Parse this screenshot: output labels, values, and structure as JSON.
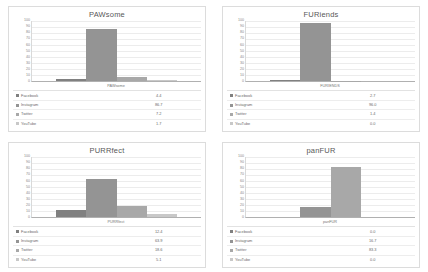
{
  "page": {
    "layout": "2x2 grid of bar charts",
    "background": "#ffffff"
  },
  "series_colors": {
    "Facebook": "#808080",
    "Instagram": "#949494",
    "Twitter": "#a8a8a8",
    "YouTube": "#c8c8c8"
  },
  "axis": {
    "ticks": [
      "100",
      "90",
      "80",
      "70",
      "60",
      "50",
      "40",
      "30",
      "20",
      "10",
      "0"
    ],
    "min": 0,
    "max": 100
  },
  "chart_data": [
    {
      "type": "bar",
      "title": "PAWsome",
      "categories": [
        "PAWsome"
      ],
      "xlabel": "PAWsome",
      "ylabel": "",
      "ylim": [
        0,
        100
      ],
      "grid": true,
      "legend_position": "bottom-table",
      "series": [
        {
          "name": "Facebook",
          "values": [
            4.4
          ],
          "value_label": "4.4"
        },
        {
          "name": "Instagram",
          "values": [
            86.7
          ],
          "value_label": "86.7"
        },
        {
          "name": "Twitter",
          "values": [
            7.2
          ],
          "value_label": "7.2"
        },
        {
          "name": "YouTube",
          "values": [
            1.7
          ],
          "value_label": "1.7"
        }
      ]
    },
    {
      "type": "bar",
      "title": "FURiends",
      "categories": [
        "FURIENDS"
      ],
      "xlabel": "FURIENDS",
      "ylabel": "",
      "ylim": [
        0,
        100
      ],
      "grid": true,
      "legend_position": "bottom-table",
      "series": [
        {
          "name": "Facebook",
          "values": [
            2.7
          ],
          "value_label": "2.7"
        },
        {
          "name": "Instagram",
          "values": [
            96.0
          ],
          "value_label": "96.0"
        },
        {
          "name": "Twitter",
          "values": [
            1.4
          ],
          "value_label": "1.4"
        },
        {
          "name": "YouTube",
          "values": [
            0.0
          ],
          "value_label": "0.0"
        }
      ]
    },
    {
      "type": "bar",
      "title": "PURRfect",
      "categories": [
        "PURRfect"
      ],
      "xlabel": "PURRfect",
      "ylabel": "",
      "ylim": [
        0,
        100
      ],
      "grid": true,
      "legend_position": "bottom-table",
      "series": [
        {
          "name": "Facebook",
          "values": [
            12.4
          ],
          "value_label": "12.4"
        },
        {
          "name": "Instagram",
          "values": [
            63.9
          ],
          "value_label": "63.9"
        },
        {
          "name": "Twitter",
          "values": [
            18.6
          ],
          "value_label": "18.6"
        },
        {
          "name": "YouTube",
          "values": [
            5.1
          ],
          "value_label": "5.1"
        }
      ]
    },
    {
      "type": "bar",
      "title": "panFUR",
      "categories": [
        "panFUR"
      ],
      "xlabel": "panFUR",
      "ylabel": "",
      "ylim": [
        0,
        100
      ],
      "grid": true,
      "legend_position": "bottom-table",
      "series": [
        {
          "name": "Facebook",
          "values": [
            0.0
          ],
          "value_label": "0.0"
        },
        {
          "name": "Instagram",
          "values": [
            16.7
          ],
          "value_label": "16.7"
        },
        {
          "name": "Twitter",
          "values": [
            83.3
          ],
          "value_label": "83.3"
        },
        {
          "name": "YouTube",
          "values": [
            0.0
          ],
          "value_label": "0.0"
        }
      ]
    }
  ]
}
